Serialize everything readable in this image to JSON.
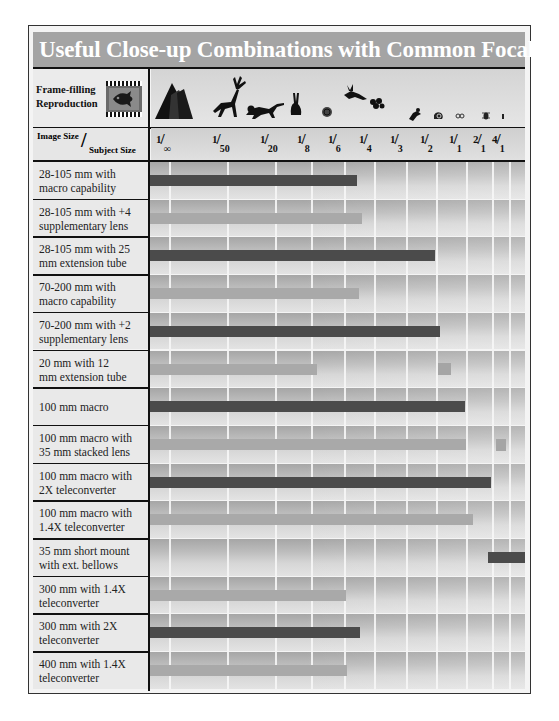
{
  "title": "Useful Close-up Combinations with Common Focal Lengths",
  "header": {
    "frame_filling_label_line1": "Frame-filling",
    "frame_filling_label_line2": "Reproduction",
    "frame_icon": "film-frame-fish-icon",
    "subject_icons": [
      "mountain-icon",
      "deer-icon",
      "monkey-icon",
      "rabbit-icon",
      "turtle-icon",
      "bird-icon",
      "flower-icon",
      "lizard-icon",
      "snail-icon",
      "ring-icon",
      "bug-icon",
      "ant-icon"
    ],
    "axis_left_top": "Image Size",
    "axis_left_slash": "/",
    "axis_left_bottom": "Subject Size"
  },
  "colors": {
    "title_bg": "#a4a4a4",
    "bar_dark": "#4b4b4b",
    "bar_light": "#a9a9a9",
    "border": "#111111"
  },
  "chart_data": {
    "type": "bar",
    "orientation": "horizontal",
    "title": "Useful Close-up Combinations with Common Focal Lengths",
    "xlabel": "Image Size / Subject Size (magnification)",
    "ylabel": "",
    "x_ticks": [
      "1/∞",
      "1/50",
      "1/20",
      "1/8",
      "1/6",
      "1/4",
      "1/3",
      "1/2",
      "1/1",
      "2/1",
      "4/1"
    ],
    "x_ticks_num": [
      "1",
      "1",
      "1",
      "1",
      "1",
      "1",
      "1",
      "1",
      "1",
      "2",
      "4"
    ],
    "x_ticks_den": [
      "∞",
      "50",
      "20",
      "8",
      "6",
      "4",
      "3",
      "2",
      "1",
      "1",
      "1"
    ],
    "grid": true,
    "legend": null,
    "categories": [
      "28-105 mm with macro capability",
      "28-105 mm with +4 supplementary lens",
      "28-105 mm with 25 mm extension tube",
      "70-200 mm with macro capability",
      "70-200 mm with +2 supplementary lens",
      "20 mm with 12 mm extension tube",
      "100 mm macro",
      "100 mm macro with 35 mm stacked lens",
      "100 mm macro with 2X teleconverter",
      "100 mm macro with 1.4X teleconverter",
      "35 mm short mount with ext. bellows",
      "300 mm with 1.4X teleconverter",
      "300 mm with 2X teleconverter",
      "400 mm with 1.4X teleconverter"
    ],
    "ranges": [
      {
        "from": "1/∞",
        "to": "~1/5"
      },
      {
        "from": "1/∞",
        "to": "~1/5"
      },
      {
        "from": "1/∞",
        "to": "~1/2"
      },
      {
        "from": "1/∞",
        "to": "~1/5"
      },
      {
        "from": "1/∞",
        "to": "~1/2"
      },
      {
        "from": "1/∞",
        "to": "~1/7",
        "extra": "~1/2"
      },
      {
        "from": "1/∞",
        "to": "1/1"
      },
      {
        "from": "1/∞",
        "to": "1/1",
        "extra": "~2/1"
      },
      {
        "from": "1/∞",
        "to": "2/1"
      },
      {
        "from": "1/∞",
        "to": "~1.4/1"
      },
      {
        "from": "~1.5/1",
        "to": ">4/1"
      },
      {
        "from": "1/∞",
        "to": "~1/6"
      },
      {
        "from": "1/∞",
        "to": "~1/5"
      },
      {
        "from": "1/∞",
        "to": "~1/6"
      }
    ]
  },
  "rows": [
    {
      "line1": "28-105 mm with",
      "line2": "macro capability",
      "style": "dark",
      "bar_start": 0,
      "bar_end": 207
    },
    {
      "line1": "28-105 mm with +4",
      "line2": "supplementary lens",
      "style": "light",
      "bar_start": 0,
      "bar_end": 212
    },
    {
      "line1": "28-105 mm with 25",
      "line2": "mm extension tube",
      "style": "dark",
      "bar_start": 0,
      "bar_end": 285
    },
    {
      "line1": "70-200 mm with",
      "line2": "macro capability",
      "style": "light",
      "bar_start": 0,
      "bar_end": 209
    },
    {
      "line1": "70-200 mm with +2",
      "line2": "supplementary lens",
      "style": "dark",
      "bar_start": 0,
      "bar_end": 290
    },
    {
      "line1": "20 mm with 12",
      "line2": "mm extension tube",
      "style": "light",
      "bar_start": 0,
      "bar_end": 167,
      "sq_start": 288,
      "sq_end": 301
    },
    {
      "line1": "100 mm macro",
      "line2": "",
      "style": "dark",
      "bar_start": 0,
      "bar_end": 315
    },
    {
      "line1": "100 mm macro with",
      "line2": "35 mm stacked lens",
      "style": "light",
      "bar_start": 0,
      "bar_end": 316,
      "sq_start": 346,
      "sq_end": 356
    },
    {
      "line1": "100 mm macro with",
      "line2": "2X  teleconverter",
      "style": "dark",
      "bar_start": 0,
      "bar_end": 341
    },
    {
      "line1": "100 mm macro with",
      "line2": "1.4X  teleconverter",
      "style": "light",
      "bar_start": 0,
      "bar_end": 323
    },
    {
      "line1": "35 mm short mount",
      "line2": "with ext. bellows",
      "style": "dark",
      "bar_start": 338,
      "bar_end": 375
    },
    {
      "line1": "300 mm with 1.4X",
      "line2": "teleconverter",
      "style": "light",
      "bar_start": 0,
      "bar_end": 196
    },
    {
      "line1": "300 mm with 2X",
      "line2": "teleconverter",
      "style": "dark",
      "bar_start": 0,
      "bar_end": 210
    },
    {
      "line1": "400 mm with 1.4X",
      "line2": "teleconverter",
      "style": "light",
      "bar_start": 0,
      "bar_end": 197
    }
  ],
  "gridlines_x": [
    19,
    77,
    125,
    161,
    194,
    224,
    256,
    286,
    316,
    342,
    359
  ]
}
